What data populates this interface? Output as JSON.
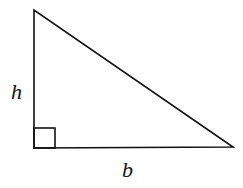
{
  "diagram": {
    "type": "right-triangle",
    "labels": {
      "height": "h",
      "base": "b"
    },
    "vertices": {
      "top": [
        34,
        10
      ],
      "right_angle": [
        34,
        148
      ],
      "bottom_right": [
        233,
        147
      ]
    },
    "stroke_color": "#111111",
    "background": "#ffffff"
  }
}
